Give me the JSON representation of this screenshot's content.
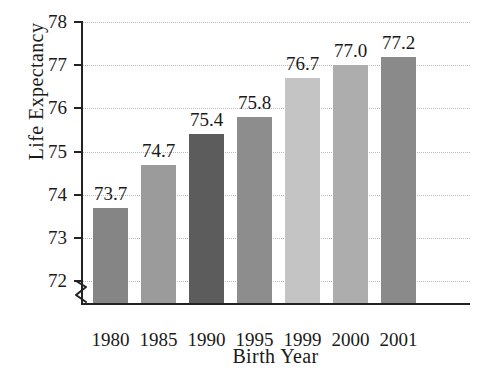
{
  "chart_data": {
    "type": "bar",
    "title": "",
    "xlabel": "Birth Year",
    "ylabel": "Life Expectancy",
    "categories": [
      "1980",
      "1985",
      "1990",
      "1995",
      "1999",
      "2000",
      "2001"
    ],
    "values": [
      73.7,
      74.7,
      75.4,
      75.8,
      76.7,
      77.0,
      77.2
    ],
    "value_labels": [
      "73.7",
      "74.7",
      "75.4",
      "75.8",
      "76.7",
      "77.0",
      "77.2"
    ],
    "ylim": [
      71.5,
      78
    ],
    "yticks": [
      72,
      73,
      74,
      75,
      76,
      77,
      78
    ],
    "ytick_labels": [
      "72",
      "73",
      "74",
      "75",
      "76",
      "77",
      "78"
    ],
    "grid": true,
    "grid_style": "dotted",
    "legend": "none",
    "axis_break": true,
    "axis_break_note": "y-axis broken below 72",
    "bar_colors": [
      "#858585",
      "#9b9b9b",
      "#5c5c5c",
      "#8d8d8d",
      "#c4c4c4",
      "#adadad",
      "#8a8a8a"
    ]
  },
  "colors": {
    "background": "#ffffff",
    "axis": "#222222",
    "gridline": "#b9b9b9",
    "text": "#1a1a1a"
  }
}
